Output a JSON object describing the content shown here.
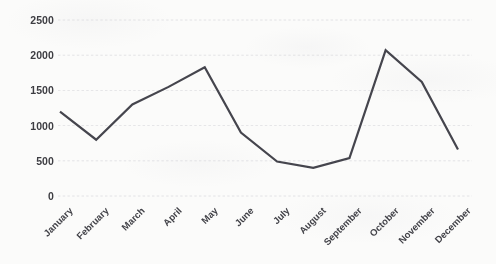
{
  "chart_data": {
    "type": "line",
    "title": "",
    "subtitle": "",
    "xlabel": "",
    "ylabel": "",
    "categories": [
      "January",
      "February",
      "March",
      "April",
      "May",
      "June",
      "July",
      "August",
      "September",
      "October",
      "November",
      "December"
    ],
    "series": [
      {
        "name": "Series 1",
        "values": [
          1200,
          800,
          1300,
          1550,
          1830,
          900,
          490,
          400,
          540,
          2070,
          1620,
          660
        ],
        "color": "#45454e"
      }
    ],
    "ylim": [
      0,
      2500
    ],
    "yticks": [
      2500,
      2000,
      1500,
      1000,
      500,
      0
    ],
    "ytick_labels": [
      "2500",
      "2000",
      "1500",
      "1000",
      "500",
      "0"
    ],
    "grid": true,
    "grid_axis": "y",
    "grid_color": "#d8d8dc",
    "legend": false,
    "legend_position": "none",
    "markers": false,
    "x_label_rotation": -45,
    "background_color": "#fbfbfa",
    "line_width": 2.2
  }
}
